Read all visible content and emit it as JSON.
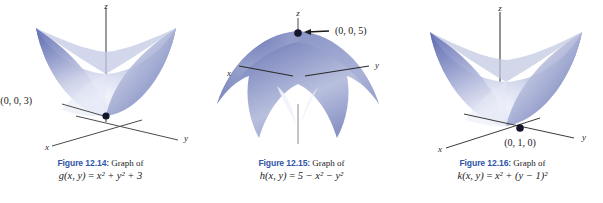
{
  "document": {
    "type": "textbook-figure-row",
    "background_color": "#ffffff",
    "surface_color_dark": "#6a76b8",
    "surface_color_mid": "#9aa3cf",
    "surface_color_light": "#eceefa",
    "axis_color": "#3a3a3a",
    "caption_label_color": "#2f56a8",
    "caption_text_color": "#1b1b1b"
  },
  "panels": [
    {
      "id": "panel-1214",
      "figure_label": "Figure 12.14",
      "figure_separator": ":",
      "caption_lead": "Graph of",
      "formula_parts": {
        "fn": "g",
        "args": "(x, y)",
        "equals": "=",
        "body": "x² + y² + 3"
      },
      "axes": {
        "x": "x",
        "y": "y",
        "z": "z"
      },
      "point_label": "(0, 0, 3)",
      "point_label_position": "left",
      "surface_type": "paraboloid-up",
      "vertex": [
        0,
        0,
        3
      ]
    },
    {
      "id": "panel-1215",
      "figure_label": "Figure 12.15",
      "figure_separator": ":",
      "caption_lead": "Graph of",
      "formula_parts": {
        "fn": "h",
        "args": "(x, y)",
        "equals": "=",
        "body": "5 − x² − y²"
      },
      "axes": {
        "x": "x",
        "y": "y",
        "z": "z"
      },
      "point_label": "(0, 0, 5)",
      "point_label_position": "right",
      "surface_type": "paraboloid-down",
      "vertex": [
        0,
        0,
        5
      ]
    },
    {
      "id": "panel-1216",
      "figure_label": "Figure 12.16",
      "figure_separator": ":",
      "caption_lead": "Graph of",
      "formula_parts": {
        "fn": "k",
        "args": "(x, y)",
        "equals": "=",
        "body": "x² + (y − 1)²"
      },
      "axes": {
        "x": "x",
        "y": "y",
        "z": "z"
      },
      "point_label": "(0, 1, 0)",
      "point_label_position": "below",
      "surface_type": "paraboloid-up-shifted",
      "vertex": [
        0,
        1,
        0
      ]
    }
  ]
}
